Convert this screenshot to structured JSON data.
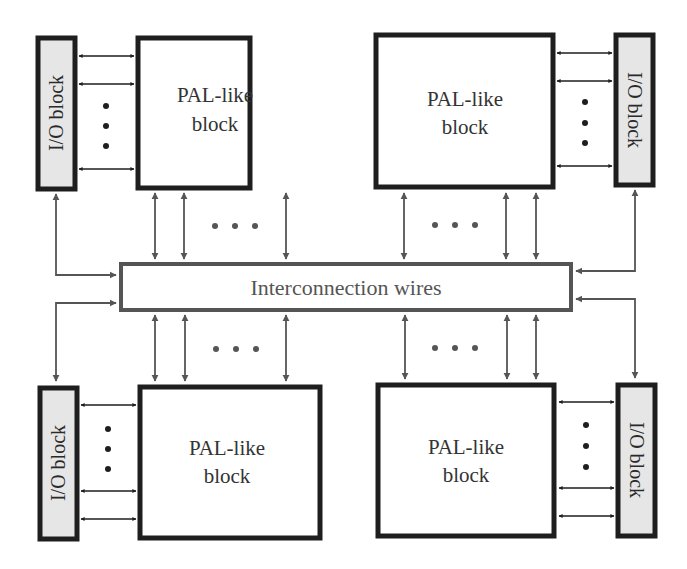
{
  "diagram": {
    "type": "block-diagram",
    "colors": {
      "block_border": "#1e1e1e",
      "io_fill": "#e6e6e6",
      "interconnect_border": "#555555",
      "wire": "#555555",
      "io_arrow": "#1e1e1e",
      "text": "#333333"
    },
    "interconnect": {
      "label": "Interconnection wires"
    },
    "pal_blocks": [
      {
        "position": "top-left",
        "line1": "PAL-like",
        "line2": "block"
      },
      {
        "position": "top-right",
        "line1": "PAL-like",
        "line2": "block"
      },
      {
        "position": "bottom-left",
        "line1": "PAL-like",
        "line2": "block"
      },
      {
        "position": "bottom-right",
        "line1": "PAL-like",
        "line2": "block"
      }
    ],
    "io_blocks": [
      {
        "position": "top-left",
        "label": "I/O block"
      },
      {
        "position": "top-right",
        "label": "I/O block"
      },
      {
        "position": "bottom-left",
        "label": "I/O block"
      },
      {
        "position": "bottom-right",
        "label": "I/O block"
      }
    ],
    "ellipsis": "…"
  }
}
